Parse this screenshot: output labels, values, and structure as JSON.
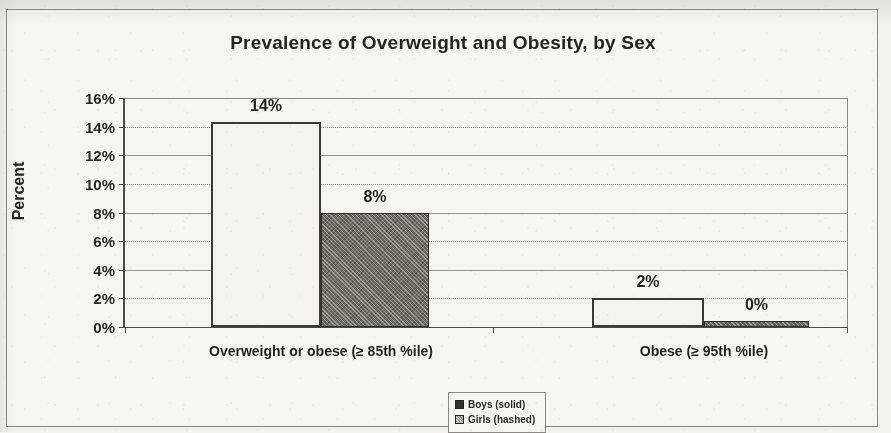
{
  "chart_data": {
    "type": "bar",
    "title": "Prevalence of Overweight and Obesity, by Sex",
    "xlabel": "",
    "ylabel": "Percent",
    "ylim": [
      0,
      16
    ],
    "ytick_labels": [
      "16%",
      "14%",
      "12%",
      "10%",
      "8%",
      "6%",
      "4%",
      "2%",
      "0%"
    ],
    "ytick_values": [
      16,
      14,
      12,
      10,
      8,
      6,
      4,
      2,
      0
    ],
    "grid": true,
    "legend_position": "bottom-center",
    "categories": [
      "Overweight or obese (≥ 85th %ile)",
      "Obese (≥ 95th %ile)"
    ],
    "series": [
      {
        "name": "Boys (solid)",
        "values": [
          14.3,
          2.0
        ],
        "data_labels": [
          "14%",
          "2%"
        ],
        "fill": "#f4f3ef",
        "stroke": "#3a3832"
      },
      {
        "name": "Girls (hashed)",
        "values": [
          8.0,
          0.4
        ],
        "data_labels": [
          "8%",
          "0%"
        ],
        "fill": "#6f6c64",
        "stroke": "#2f2d28"
      }
    ]
  },
  "legend": {
    "entries": [
      {
        "label": "Boys (solid)",
        "swatch": "solid-square-icon"
      },
      {
        "label": "Girls (hashed)",
        "swatch": "hashed-square-icon"
      }
    ]
  },
  "colors": {
    "page_background": "#f2f1ee",
    "chart_background": "#f6f5f2",
    "frame": "#8b8880",
    "axis": "#4d4a44",
    "gridline": "#9a968d",
    "text": "#26241f"
  }
}
